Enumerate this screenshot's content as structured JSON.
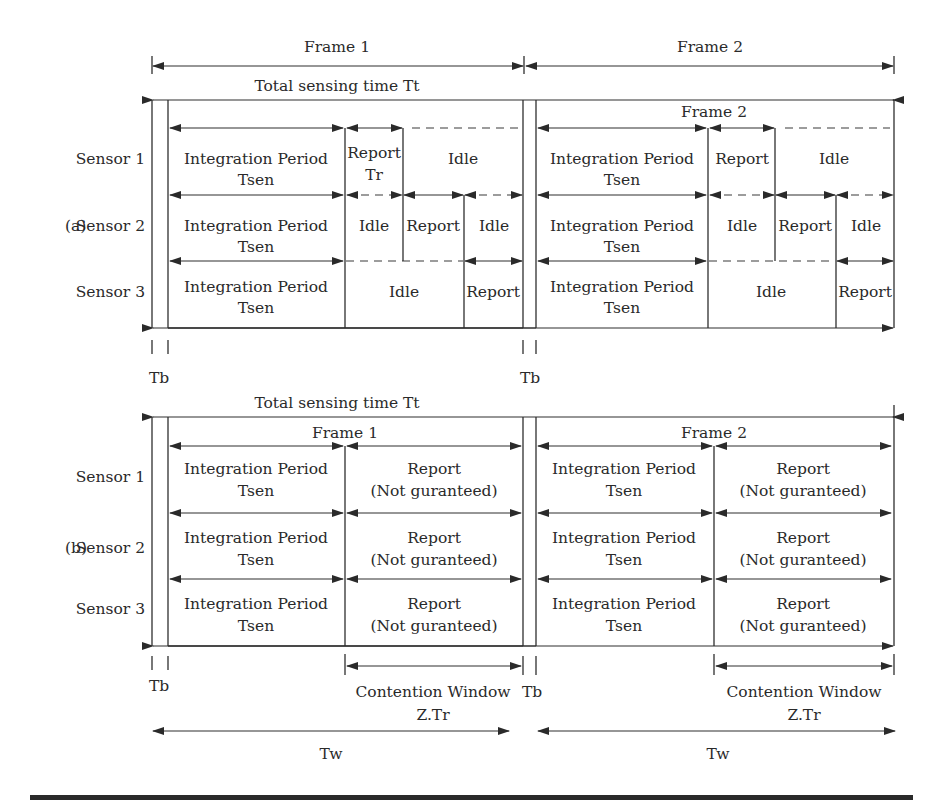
{
  "colors": {
    "ink": "#2a2a2a",
    "background": "#ffffff"
  },
  "top": {
    "frame1": "Frame 1",
    "frame2": "Frame 2"
  },
  "panel_a": {
    "label": "(a)",
    "total": "Total sensing time Tt",
    "frame2_inner": "Frame 2",
    "sensors": [
      "Sensor 1",
      "Sensor 2",
      "Sensor 3"
    ],
    "integ_line1": "Integration Period",
    "integ_line2": "Tsen",
    "s1_report_l1": "Report",
    "s1_report_l2": "Tr",
    "report": "Report",
    "idle": "Idle",
    "tb": "Tb"
  },
  "panel_b": {
    "label": "(b)",
    "total": "Total sensing time Tt",
    "frame1": "Frame 1",
    "frame2": "Frame 2",
    "sensors": [
      "Sensor 1",
      "Sensor 2",
      "Sensor 3"
    ],
    "integ_line1": "Integration Period",
    "integ_line2": "Tsen",
    "report_l1": "Report",
    "report_l2": "(Not guranteed)",
    "tb": "Tb",
    "cw_l1": "Contention Window",
    "cw_l2": "Z.Tr",
    "tw": "Tw"
  }
}
